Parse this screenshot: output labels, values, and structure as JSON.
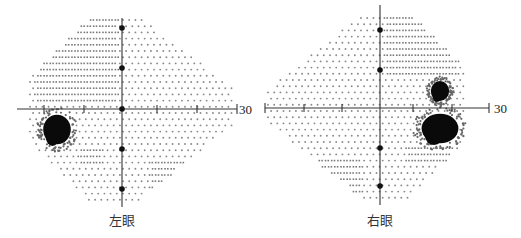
{
  "figure": {
    "axis_extent_label": "30",
    "colors": {
      "axis": "#333333",
      "dot": "#8a8a8a",
      "dash": "#7a7a7a",
      "scotoma": "#0a0a0a"
    }
  },
  "left_eye": {
    "label": "左眼",
    "axis_end_label": "30",
    "center": [
      122,
      109
    ],
    "axis_marker_dots_y": [
      28,
      68,
      109,
      149,
      189
    ],
    "x_ticks": [
      44,
      84,
      157,
      197
    ],
    "defects": [
      {
        "type": "absolute-scotoma",
        "region": "temporal-inferior (blind spot)",
        "bbox": [
          42,
          113,
          72,
          146
        ]
      },
      {
        "type": "relative-depression",
        "region": "superior-nasal",
        "bbox": [
          35,
          20,
          117,
          104
        ]
      },
      {
        "type": "relative-depression",
        "region": "inferior",
        "bbox": [
          78,
          148,
          102,
          168
        ]
      },
      {
        "type": "relative-depression",
        "region": "inferior-temporal",
        "bbox": [
          148,
          160,
          182,
          192
        ]
      }
    ]
  },
  "right_eye": {
    "label": "右眼",
    "axis_end_label": "30",
    "center": [
      380,
      108
    ],
    "axis_marker_dots_y": [
      30,
      70,
      148,
      186
    ],
    "x_ticks": [
      304,
      342,
      413,
      452
    ],
    "defects": [
      {
        "type": "absolute-scotoma",
        "region": "temporal (blind spot)",
        "bbox": [
          420,
          112,
          460,
          145
        ]
      },
      {
        "type": "absolute-scotoma",
        "region": "temporal-superior",
        "bbox": [
          430,
          80,
          450,
          102
        ]
      },
      {
        "type": "relative-depression",
        "region": "superior-temporal",
        "bbox": [
          383,
          18,
          460,
          80
        ]
      },
      {
        "type": "relative-depression",
        "region": "inferior-temporal",
        "bbox": [
          405,
          145,
          455,
          165
        ]
      },
      {
        "type": "relative-depression",
        "region": "inferior-nasal",
        "bbox": [
          318,
          160,
          362,
          196
        ]
      }
    ]
  }
}
